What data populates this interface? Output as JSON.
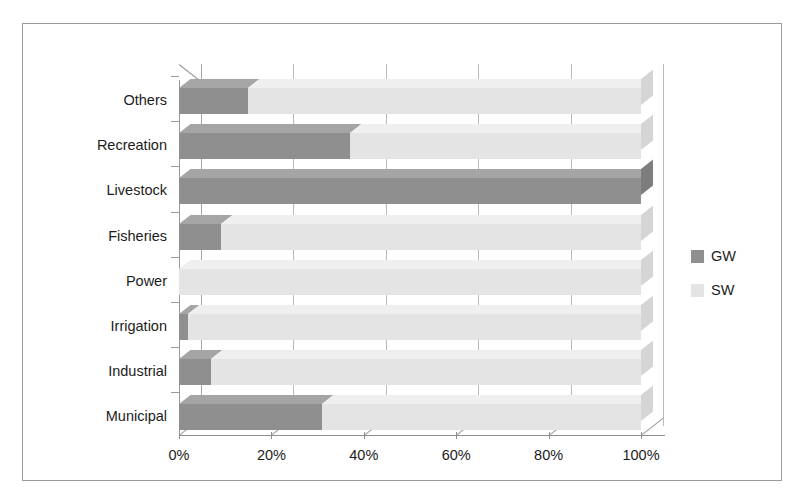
{
  "chart_data": {
    "type": "bar",
    "orientation": "horizontal",
    "stacked": true,
    "normalized": "100%",
    "title": "",
    "subtitle": "",
    "xlabel": "",
    "ylabel": "",
    "xlim": [
      0,
      100
    ],
    "xticks": [
      0,
      20,
      40,
      60,
      80,
      100
    ],
    "xtick_labels": [
      "0%",
      "20%",
      "40%",
      "60%",
      "80%",
      "100%"
    ],
    "grid": true,
    "grid_axis": "x",
    "legend_position": "right",
    "three_d": true,
    "categories": [
      "Municipal",
      "Industrial",
      "Irrigation",
      "Power",
      "Fisheries",
      "Livestock",
      "Recreation",
      "Others"
    ],
    "categories_top_to_bottom": [
      "Others",
      "Recreation",
      "Livestock",
      "Fisheries",
      "Power",
      "Irrigation",
      "Industrial",
      "Municipal"
    ],
    "series": [
      {
        "name": "GW",
        "color": "#8f8f8f",
        "values": [
          31,
          7,
          2,
          0,
          9,
          100,
          37,
          15
        ]
      },
      {
        "name": "SW",
        "color": "#e4e4e4",
        "values": [
          69,
          93,
          98,
          100,
          91,
          0,
          63,
          85
        ]
      }
    ]
  },
  "axis": {
    "category_labels": [
      "Others",
      "Recreation",
      "Livestock",
      "Fisheries",
      "Power",
      "Irrigation",
      "Industrial",
      "Municipal"
    ],
    "x_tick_labels": [
      "0%",
      "20%",
      "40%",
      "60%",
      "80%",
      "100%"
    ]
  },
  "legend": {
    "items": [
      {
        "label": "GW",
        "color": "#8f8f8f"
      },
      {
        "label": "SW",
        "color": "#e4e4e4"
      }
    ]
  },
  "colors": {
    "gw": "#8f8f8f",
    "sw": "#e4e4e4",
    "border": "#9a9a9a",
    "gridline": "#b9b9b9",
    "text": "#1c1c1c",
    "background": "#ffffff"
  }
}
